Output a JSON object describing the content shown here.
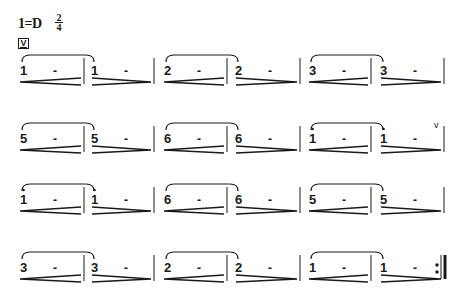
{
  "header": {
    "key_signature": "1=D",
    "time_signature": {
      "numerator": "2",
      "denominator": "4"
    },
    "bowing_mark": "V"
  },
  "score": {
    "rows": [
      {
        "y": 70,
        "measures": [
          {
            "note": "1",
            "octave": 0,
            "dash": "-",
            "dynamic": "crescendo",
            "slur_start": true
          },
          {
            "note": "1",
            "octave": 0,
            "dash": "-",
            "dynamic": "decrescendo",
            "slur_end": true
          },
          {
            "note": "2",
            "octave": 0,
            "dash": "-",
            "dynamic": "crescendo",
            "slur_start": true
          },
          {
            "note": "2",
            "octave": 0,
            "dash": "-",
            "dynamic": "decrescendo",
            "slur_end": true
          },
          {
            "note": "3",
            "octave": 0,
            "dash": "-",
            "dynamic": "crescendo",
            "slur_start": true
          },
          {
            "note": "3",
            "octave": 0,
            "dash": "-",
            "dynamic": "decrescendo",
            "slur_end": true
          }
        ]
      },
      {
        "y": 138,
        "measures": [
          {
            "note": "5",
            "octave": 0,
            "dash": "-",
            "dynamic": "crescendo",
            "slur_start": true
          },
          {
            "note": "5",
            "octave": 0,
            "dash": "-",
            "dynamic": "decrescendo",
            "slur_end": true
          },
          {
            "note": "6",
            "octave": 0,
            "dash": "-",
            "dynamic": "crescendo",
            "slur_start": true
          },
          {
            "note": "6",
            "octave": 0,
            "dash": "-",
            "dynamic": "decrescendo",
            "slur_end": true
          },
          {
            "note": "1",
            "octave": 1,
            "dash": "-",
            "dynamic": "crescendo",
            "slur_start": true
          },
          {
            "note": "1",
            "octave": 1,
            "dash": "-",
            "dynamic": "decrescendo",
            "slur_end": true,
            "breath_mark": "v"
          }
        ]
      },
      {
        "y": 199,
        "measures": [
          {
            "note": "1",
            "octave": 1,
            "dash": "-",
            "dynamic": "crescendo",
            "slur_start": true
          },
          {
            "note": "1",
            "octave": 1,
            "dash": "-",
            "dynamic": "decrescendo",
            "slur_end": true
          },
          {
            "note": "6",
            "octave": 0,
            "dash": "-",
            "dynamic": "crescendo",
            "slur_start": true
          },
          {
            "note": "6",
            "octave": 0,
            "dash": "-",
            "dynamic": "decrescendo",
            "slur_end": true
          },
          {
            "note": "5",
            "octave": 0,
            "dash": "-",
            "dynamic": "crescendo",
            "slur_start": true
          },
          {
            "note": "5",
            "octave": 0,
            "dash": "-",
            "dynamic": "decrescendo",
            "slur_end": true
          }
        ]
      },
      {
        "y": 267,
        "measures": [
          {
            "note": "3",
            "octave": 0,
            "dash": "-",
            "dynamic": "crescendo",
            "slur_start": true
          },
          {
            "note": "3",
            "octave": 0,
            "dash": "-",
            "dynamic": "decrescendo",
            "slur_end": true
          },
          {
            "note": "2",
            "octave": 0,
            "dash": "-",
            "dynamic": "crescendo",
            "slur_start": true
          },
          {
            "note": "2",
            "octave": 0,
            "dash": "-",
            "dynamic": "decrescendo",
            "slur_end": true
          },
          {
            "note": "1",
            "octave": 0,
            "dash": "-",
            "dynamic": "crescendo",
            "slur_start": true
          },
          {
            "note": "1",
            "octave": 0,
            "dash": "-",
            "dynamic": "decrescendo",
            "slur_end": true,
            "end_repeat": true
          }
        ]
      }
    ],
    "measure_x": [
      20,
      91,
      164,
      235,
      309,
      380
    ],
    "barline_x": [
      84,
      154,
      227,
      300,
      371,
      444
    ]
  },
  "colors": {
    "ink": "#1a1a1a",
    "background": "#ffffff"
  }
}
